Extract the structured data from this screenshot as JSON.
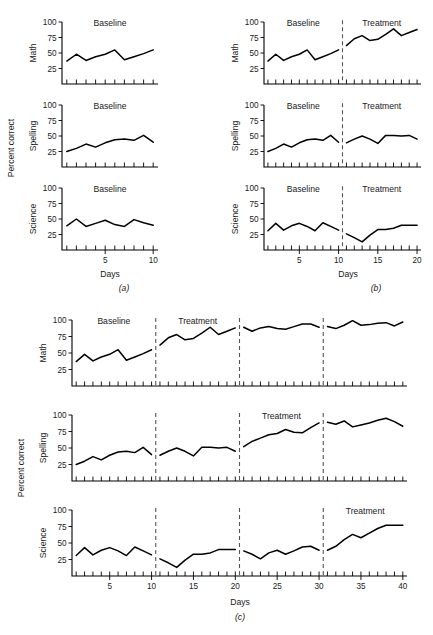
{
  "figure": {
    "y_axis_label": "Percent correct",
    "x_axis_label": "Days",
    "row_labels": [
      "Math",
      "Spelling",
      "Science"
    ],
    "y_ticks": [
      "25",
      "50",
      "75",
      "100"
    ],
    "y_range": [
      0,
      100
    ],
    "phase_baseline": "Baseline",
    "phase_treatment": "Treatment",
    "captions": {
      "a": "(a)",
      "b": "(b)",
      "c": "(c)"
    }
  },
  "chart_data": [
    {
      "id": "panel-a",
      "type": "line",
      "title": "(a)",
      "xlabel": "Days",
      "ylabel": "Percent correct",
      "ylim": [
        0,
        100
      ],
      "xlim": [
        0.5,
        10.5
      ],
      "x_ticks": [
        "5",
        "10"
      ],
      "x_tick_values": [
        5,
        10
      ],
      "grid": false,
      "legend": "none",
      "phase_labels": [
        {
          "text": "Baseline",
          "start": 1,
          "end": 10
        }
      ],
      "dividers": [],
      "series": [
        {
          "name": "Math",
          "x": [
            1,
            2,
            3,
            4,
            5,
            6,
            7,
            8,
            9,
            10
          ],
          "values": [
            37,
            48,
            38,
            44,
            48,
            55,
            39,
            44,
            49,
            55
          ]
        },
        {
          "name": "Spelling",
          "x": [
            1,
            2,
            3,
            4,
            5,
            6,
            7,
            8,
            9,
            10
          ],
          "values": [
            25,
            30,
            37,
            32,
            39,
            44,
            45,
            43,
            51,
            40
          ]
        },
        {
          "name": "Science",
          "x": [
            1,
            2,
            3,
            4,
            5,
            6,
            7,
            8,
            9,
            10
          ],
          "values": [
            39,
            50,
            38,
            43,
            48,
            41,
            38,
            49,
            44,
            40
          ]
        }
      ]
    },
    {
      "id": "panel-b",
      "type": "line",
      "title": "(b)",
      "xlabel": "Days",
      "ylabel": "Percent correct",
      "ylim": [
        0,
        100
      ],
      "xlim": [
        0.5,
        20.5
      ],
      "x_ticks": [
        "5",
        "10",
        "15",
        "20"
      ],
      "x_tick_values": [
        5,
        10,
        15,
        20
      ],
      "grid": false,
      "legend": "none",
      "phase_labels": [
        {
          "text": "Baseline",
          "start": 1,
          "end": 10
        },
        {
          "text": "Treatment",
          "start": 11,
          "end": 20
        }
      ],
      "dividers": [
        10.5
      ],
      "series": [
        {
          "name": "Math",
          "segments": [
            {
              "phase": "Baseline",
              "x": [
                1,
                2,
                3,
                4,
                5,
                6,
                7,
                8,
                9,
                10
              ],
              "values": [
                37,
                48,
                38,
                44,
                48,
                55,
                39,
                44,
                49,
                55
              ]
            },
            {
              "phase": "Treatment",
              "x": [
                11,
                12,
                13,
                14,
                15,
                16,
                17,
                18,
                19,
                20
              ],
              "values": [
                62,
                73,
                78,
                70,
                72,
                80,
                89,
                78,
                83,
                88
              ]
            }
          ]
        },
        {
          "name": "Spelling",
          "segments": [
            {
              "phase": "Baseline",
              "x": [
                1,
                2,
                3,
                4,
                5,
                6,
                7,
                8,
                9,
                10
              ],
              "values": [
                25,
                30,
                37,
                32,
                39,
                44,
                45,
                43,
                51,
                40
              ]
            },
            {
              "phase": "Treatment",
              "x": [
                11,
                12,
                13,
                14,
                15,
                16,
                17,
                18,
                19,
                20
              ],
              "values": [
                39,
                45,
                50,
                45,
                38,
                51,
                51,
                50,
                51,
                45
              ]
            }
          ]
        },
        {
          "name": "Science",
          "segments": [
            {
              "phase": "Baseline",
              "x": [
                1,
                2,
                3,
                4,
                5,
                6,
                7,
                8,
                9,
                10
              ],
              "values": [
                31,
                43,
                32,
                39,
                43,
                38,
                31,
                44,
                38,
                32
              ]
            },
            {
              "phase": "Treatment",
              "x": [
                11,
                12,
                13,
                14,
                15,
                16,
                17,
                18,
                19,
                20
              ],
              "values": [
                26,
                20,
                13,
                24,
                33,
                33,
                35,
                40,
                40,
                40
              ]
            }
          ]
        }
      ]
    },
    {
      "id": "panel-c",
      "type": "line",
      "title": "(c)",
      "xlabel": "Days",
      "ylabel": "Percent correct",
      "ylim": [
        0,
        100
      ],
      "xlim": [
        0.5,
        40.5
      ],
      "x_ticks": [
        "5",
        "10",
        "15",
        "20",
        "25",
        "30",
        "35",
        "40"
      ],
      "x_tick_values": [
        5,
        10,
        15,
        20,
        25,
        30,
        35,
        40
      ],
      "grid": false,
      "legend": "none",
      "dividers": [
        10.5,
        20.5,
        30.5
      ],
      "phase_labels_math": [
        {
          "text": "Baseline",
          "start": 1,
          "end": 10
        },
        {
          "text": "Treatment",
          "start": 11,
          "end": 20
        }
      ],
      "phase_labels_spelling": [
        {
          "text": "Treatment",
          "start": 21,
          "end": 30
        }
      ],
      "phase_labels_science": [
        {
          "text": "Treatment",
          "start": 31,
          "end": 40
        }
      ],
      "series": [
        {
          "name": "Math",
          "segments": [
            {
              "phase": "Baseline",
              "x": [
                1,
                2,
                3,
                4,
                5,
                6,
                7,
                8,
                9,
                10
              ],
              "values": [
                37,
                48,
                38,
                44,
                48,
                55,
                39,
                44,
                49,
                55
              ]
            },
            {
              "phase": "Treatment",
              "x": [
                11,
                12,
                13,
                14,
                15,
                16,
                17,
                18,
                19,
                20
              ],
              "values": [
                62,
                73,
                78,
                70,
                72,
                80,
                89,
                78,
                83,
                88
              ]
            },
            {
              "phase": "Treatment",
              "x": [
                21,
                22,
                23,
                24,
                25,
                26,
                27,
                28,
                29,
                30
              ],
              "values": [
                89,
                83,
                88,
                90,
                87,
                86,
                90,
                94,
                94,
                89
              ]
            },
            {
              "phase": "Treatment",
              "x": [
                31,
                32,
                33,
                34,
                35,
                36,
                37,
                38,
                39,
                40
              ],
              "values": [
                90,
                87,
                92,
                99,
                92,
                93,
                95,
                96,
                91,
                97
              ]
            }
          ]
        },
        {
          "name": "Spelling",
          "segments": [
            {
              "phase": "Baseline",
              "x": [
                1,
                2,
                3,
                4,
                5,
                6,
                7,
                8,
                9,
                10
              ],
              "values": [
                25,
                30,
                37,
                32,
                39,
                44,
                45,
                43,
                51,
                40
              ]
            },
            {
              "phase": "Baseline",
              "x": [
                11,
                12,
                13,
                14,
                15,
                16,
                17,
                18,
                19,
                20
              ],
              "values": [
                39,
                45,
                50,
                45,
                38,
                51,
                51,
                50,
                51,
                45
              ]
            },
            {
              "phase": "Treatment",
              "x": [
                21,
                22,
                23,
                24,
                25,
                26,
                27,
                28,
                29,
                30
              ],
              "values": [
                52,
                60,
                65,
                70,
                72,
                78,
                74,
                73,
                81,
                88
              ]
            },
            {
              "phase": "Treatment",
              "x": [
                31,
                32,
                33,
                34,
                35,
                36,
                37,
                38,
                39,
                40
              ],
              "values": [
                89,
                86,
                91,
                82,
                85,
                88,
                92,
                95,
                90,
                83
              ]
            }
          ]
        },
        {
          "name": "Science",
          "segments": [
            {
              "phase": "Baseline",
              "x": [
                1,
                2,
                3,
                4,
                5,
                6,
                7,
                8,
                9,
                10
              ],
              "values": [
                31,
                43,
                32,
                39,
                43,
                38,
                31,
                44,
                38,
                32
              ]
            },
            {
              "phase": "Baseline",
              "x": [
                11,
                12,
                13,
                14,
                15,
                16,
                17,
                18,
                19,
                20
              ],
              "values": [
                26,
                20,
                13,
                24,
                33,
                33,
                35,
                40,
                40,
                40
              ]
            },
            {
              "phase": "Baseline",
              "x": [
                21,
                22,
                23,
                24,
                25,
                26,
                27,
                28,
                29,
                30
              ],
              "values": [
                38,
                33,
                26,
                35,
                39,
                33,
                38,
                44,
                45,
                39
              ]
            },
            {
              "phase": "Treatment",
              "x": [
                31,
                32,
                33,
                34,
                35,
                36,
                37,
                38,
                39,
                40
              ],
              "values": [
                39,
                45,
                55,
                63,
                58,
                65,
                72,
                77,
                77,
                77
              ]
            }
          ]
        }
      ]
    }
  ]
}
